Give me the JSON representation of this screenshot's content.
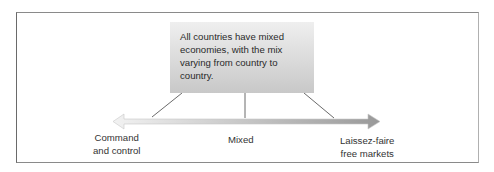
{
  "callout": {
    "text": "All countries have mixed economies, with the mix varying from country to country."
  },
  "labels": {
    "left": [
      "Command",
      "and control"
    ],
    "center": "Mixed",
    "right": [
      "Laissez-faire",
      "free markets"
    ]
  },
  "colors": {
    "arrow_light": "#ececec",
    "arrow_dark": "#9a9a9a",
    "frame": "#7a7a7a",
    "callout_top": "#efefef",
    "callout_bottom": "#c8c8c8"
  }
}
